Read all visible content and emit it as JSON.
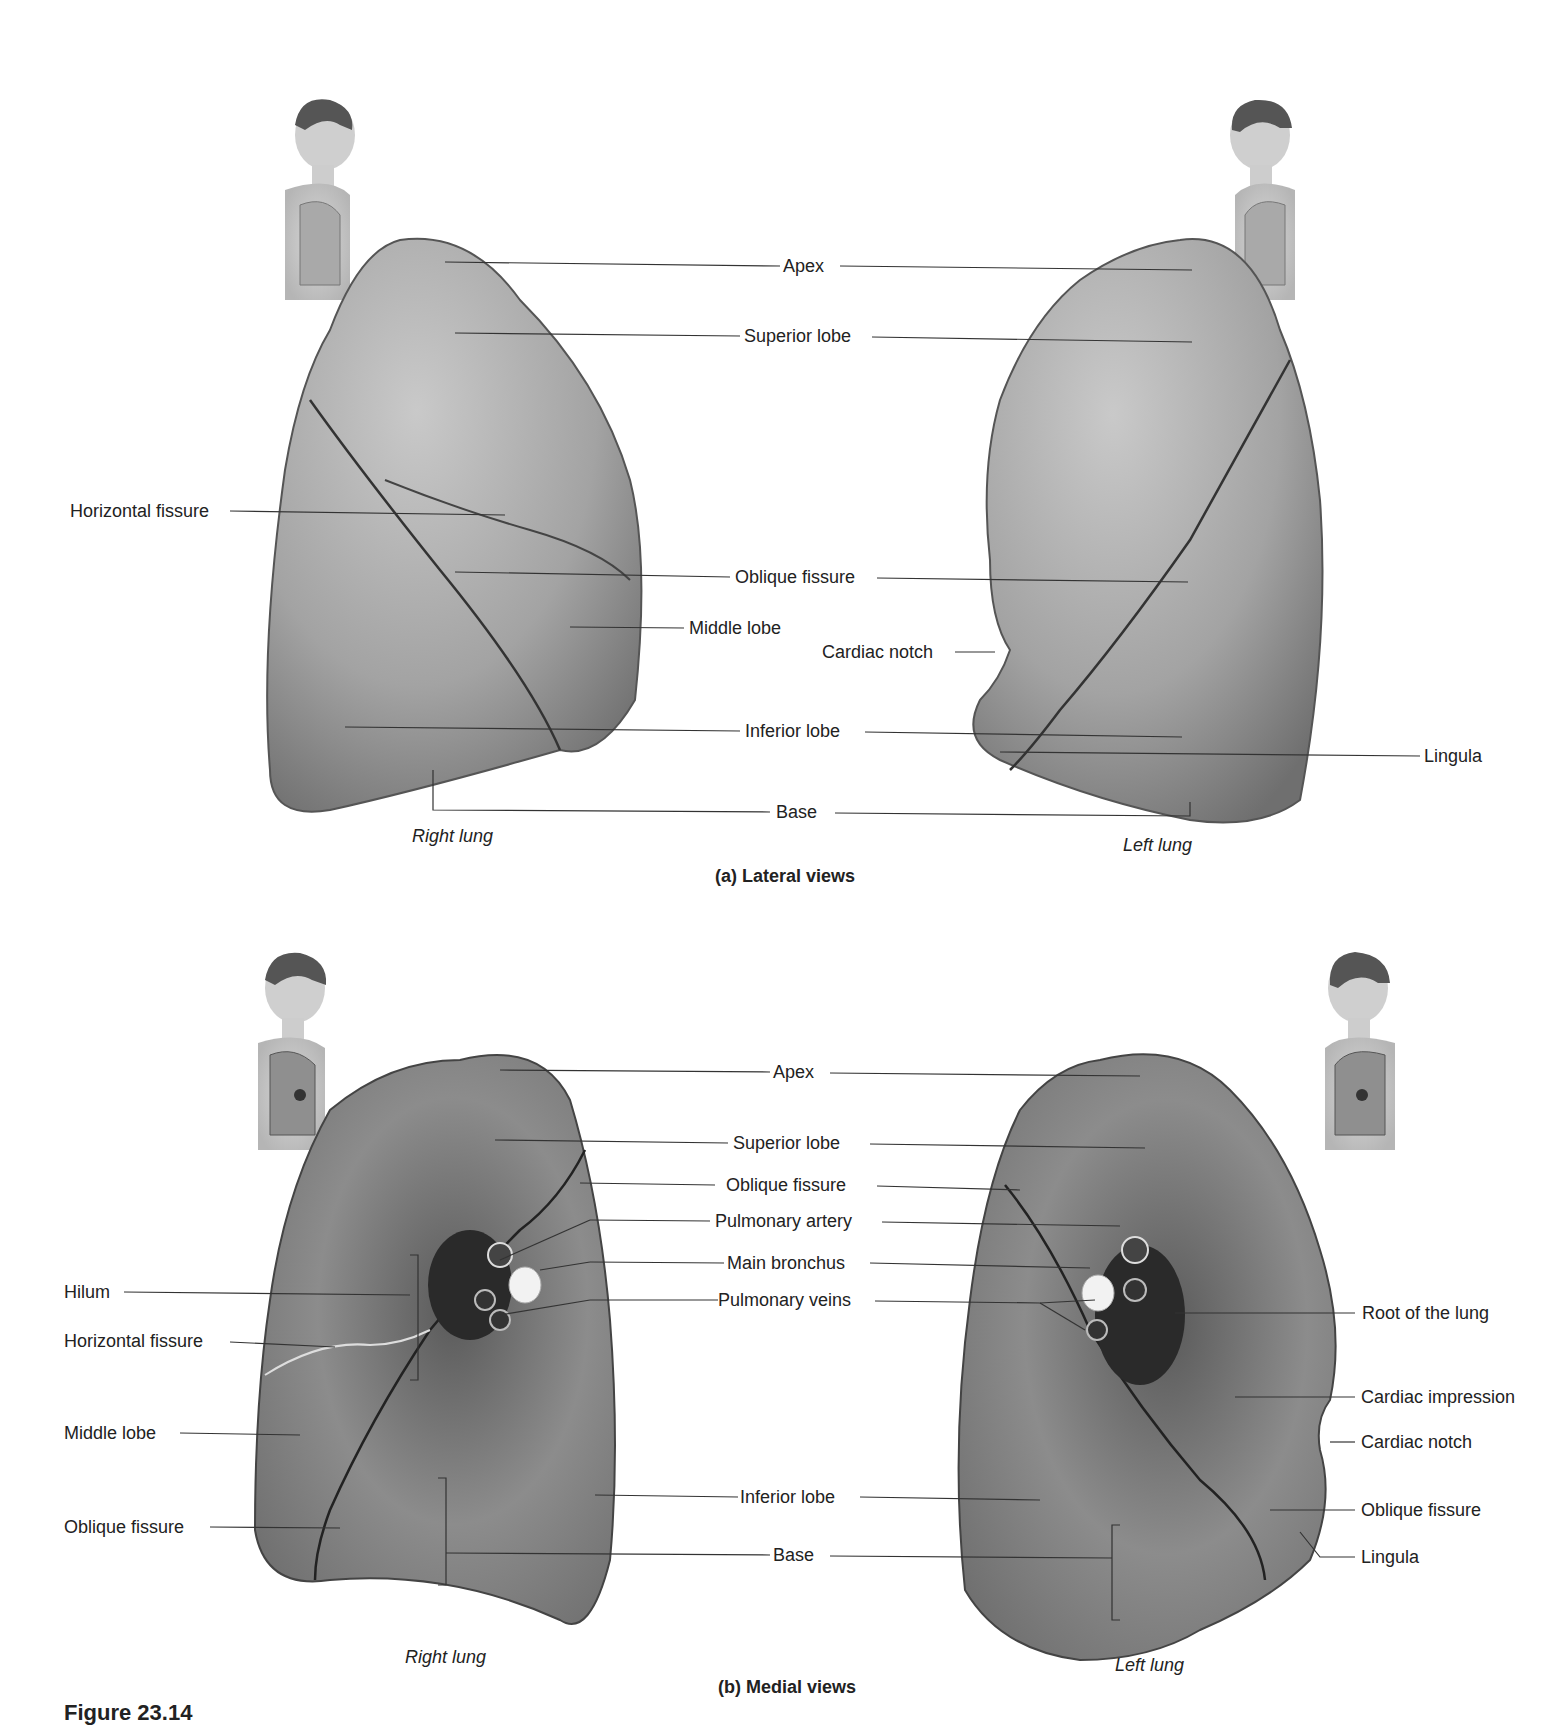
{
  "figure": {
    "figure_number_partial": "Figure 23.14",
    "panels": [
      {
        "caption": "(a) Lateral views",
        "lungs": [
          {
            "name": "Right lung",
            "orientation": "lateral"
          },
          {
            "name": "Left lung",
            "orientation": "lateral"
          }
        ],
        "labels": {
          "apex": "Apex",
          "superior_lobe": "Superior lobe",
          "horizontal_fissure": "Horizontal fissure",
          "oblique_fissure": "Oblique fissure",
          "middle_lobe": "Middle lobe",
          "cardiac_notch": "Cardiac notch",
          "inferior_lobe": "Inferior lobe",
          "lingula": "Lingula",
          "base": "Base"
        },
        "side_labels": {
          "right": "Right lung",
          "left": "Left lung"
        }
      },
      {
        "caption": "(b) Medial views",
        "lungs": [
          {
            "name": "Right lung",
            "orientation": "medial"
          },
          {
            "name": "Left lung",
            "orientation": "medial"
          }
        ],
        "labels": {
          "apex": "Apex",
          "superior_lobe": "Superior lobe",
          "oblique_fissure": "Oblique fissure",
          "pulmonary_artery": "Pulmonary artery",
          "main_bronchus": "Main bronchus",
          "pulmonary_veins": "Pulmonary veins",
          "hilum": "Hilum",
          "horizontal_fissure": "Horizontal fissure",
          "middle_lobe": "Middle lobe",
          "oblique_fissure_left": "Oblique fissure",
          "inferior_lobe": "Inferior lobe",
          "base": "Base",
          "root_of_lung": "Root of the lung",
          "cardiac_impression": "Cardiac impression",
          "cardiac_notch": "Cardiac notch",
          "oblique_fissure_right": "Oblique fissure",
          "lingula": "Lingula"
        },
        "side_labels": {
          "right": "Right lung",
          "left": "Left lung"
        }
      }
    ]
  }
}
